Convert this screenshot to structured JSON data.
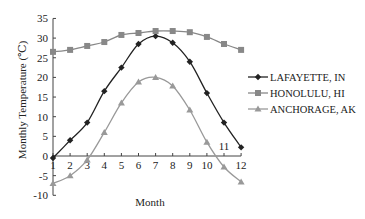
{
  "chart_data": {
    "type": "line",
    "title": "",
    "xlabel": "Month",
    "ylabel": "Monthly Temperature (℃)",
    "x": [
      1,
      2,
      3,
      4,
      5,
      6,
      7,
      8,
      9,
      10,
      11,
      12
    ],
    "xticks": [
      "1",
      "2",
      "3",
      "4",
      "5",
      "6",
      "7",
      "8",
      "9",
      "10",
      "11",
      "12"
    ],
    "yticks": [
      "-10",
      "-5",
      "0",
      "5",
      "10",
      "15",
      "20",
      "25",
      "30",
      "35"
    ],
    "ylim": [
      -10,
      35
    ],
    "grid": false,
    "legend_position": "right",
    "series": [
      {
        "name": "LAFAYETTE, IN",
        "marker": "diamond",
        "color": "#222222",
        "values": [
          -0.5,
          4,
          8.5,
          16.5,
          22.5,
          28.5,
          30.5,
          28.8,
          24,
          16,
          8.5,
          2.2
        ]
      },
      {
        "name": "HONOLULU, HI",
        "marker": "square",
        "color": "#888888",
        "values": [
          26.5,
          27,
          28,
          29,
          30.8,
          31.3,
          31.8,
          31.8,
          31.5,
          30.3,
          28.5,
          27
        ]
      },
      {
        "name": "ANCHORAGE, AK",
        "marker": "triangle",
        "color": "#999999",
        "values": [
          -7,
          -5,
          -1,
          6,
          13.5,
          18.8,
          20,
          17.8,
          11.7,
          3.5,
          -2.8,
          -6.6
        ]
      }
    ]
  }
}
